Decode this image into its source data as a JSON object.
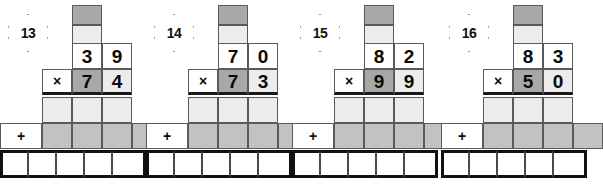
{
  "worksheet": {
    "type": "long-multiplication-grid-worksheet",
    "problem_count": 4,
    "symbols": {
      "multiply": "×",
      "plus": "+"
    },
    "colors": {
      "white": "#ffffff",
      "light_gray": "#ececec",
      "mid_gray": "#c2c2c2",
      "dark_gray": "#a8a8a8",
      "grid_line": "#5a5a5a",
      "thick_line": "#111111"
    },
    "problems": [
      {
        "number": "13",
        "multiplicand": {
          "tens": "3",
          "ones": "9"
        },
        "multiplier": {
          "tens": "7",
          "ones": "4"
        },
        "carry_top": "",
        "carry_bottom": "",
        "partial_product_1": [
          "",
          "",
          ""
        ],
        "partial_product_2": [
          "",
          "",
          "",
          ""
        ],
        "answer": [
          "",
          "",
          "",
          "",
          ""
        ]
      },
      {
        "number": "14",
        "multiplicand": {
          "tens": "7",
          "ones": "0"
        },
        "multiplier": {
          "tens": "7",
          "ones": "3"
        },
        "carry_top": "",
        "carry_bottom": "",
        "partial_product_1": [
          "",
          "",
          ""
        ],
        "partial_product_2": [
          "",
          "",
          "",
          ""
        ],
        "answer": [
          "",
          "",
          "",
          "",
          ""
        ]
      },
      {
        "number": "15",
        "multiplicand": {
          "tens": "8",
          "ones": "2"
        },
        "multiplier": {
          "tens": "9",
          "ones": "9"
        },
        "carry_top": "",
        "carry_bottom": "",
        "partial_product_1": [
          "",
          "",
          ""
        ],
        "partial_product_2": [
          "",
          "",
          "",
          ""
        ],
        "answer": [
          "",
          "",
          "",
          "",
          ""
        ]
      },
      {
        "number": "16",
        "multiplicand": {
          "tens": "8",
          "ones": "3"
        },
        "multiplier": {
          "tens": "5",
          "ones": "0"
        },
        "carry_top": "",
        "carry_bottom": "",
        "partial_product_1": [
          "",
          "",
          ""
        ],
        "partial_product_2": [
          "",
          "",
          "",
          ""
        ],
        "answer": [
          "",
          "",
          "",
          "",
          ""
        ]
      }
    ]
  }
}
